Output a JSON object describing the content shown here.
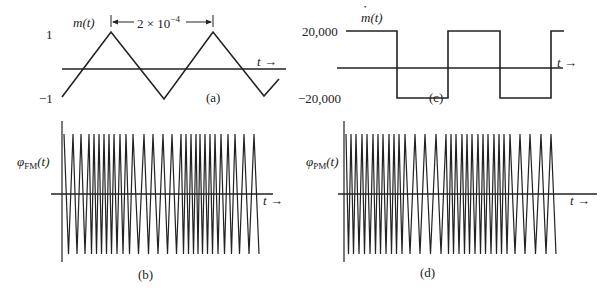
{
  "figure": {
    "panels": {
      "a": {
        "caption": "(a)",
        "ylabel_func": "m",
        "ylabel_arg": "(t)",
        "tick_top": "1",
        "tick_bottom": "−1",
        "period_label_base": "2 × 10",
        "period_label_exp": "−4",
        "axis_label": "t",
        "arrow": "→"
      },
      "b": {
        "caption": "(b)",
        "ylabel_sym": "φ",
        "ylabel_sub": "FM",
        "ylabel_arg": "(t)",
        "axis_label": "t",
        "arrow": "→"
      },
      "c": {
        "caption": "(c)",
        "ylabel_func": "m",
        "ylabel_arg": "(t)",
        "tick_top": "20,000",
        "tick_bottom": "−20,000",
        "axis_label": "t",
        "arrow": "→"
      },
      "d": {
        "caption": "(d)",
        "ylabel_sym": "φ",
        "ylabel_sub": "PM",
        "ylabel_arg": "(t)",
        "axis_label": "t",
        "arrow": "→"
      }
    }
  },
  "chart_data": [
    {
      "type": "line",
      "panel": "a",
      "title": "(a)",
      "ylabel": "m(t)",
      "xlabel": "t",
      "description": "Triangular modulating signal, period 2 × 10^-4",
      "ylim": [
        -1,
        1
      ],
      "yticks": [
        "1",
        "−1"
      ],
      "period": 0.0002,
      "points_px": [
        [
          62,
          97
        ],
        [
          111,
          32
        ],
        [
          164,
          99
        ],
        [
          213,
          32
        ],
        [
          264,
          96
        ],
        [
          279,
          79
        ]
      ]
    },
    {
      "type": "line",
      "panel": "c",
      "title": "(c)",
      "ylabel": "ṁ(t)",
      "xlabel": "t",
      "description": "Square wave derivative of m(t)",
      "ylim": [
        -20000,
        20000
      ],
      "yticks": [
        "20,000",
        "−20,000"
      ],
      "segments": [
        {
          "level": 20000,
          "x_px": [
            346,
            397
          ]
        },
        {
          "level": -20000,
          "x_px": [
            397,
            448
          ]
        },
        {
          "level": 20000,
          "x_px": [
            448,
            500
          ]
        },
        {
          "level": -20000,
          "x_px": [
            500,
            551
          ]
        },
        {
          "level": 20000,
          "x_px": [
            551,
            564
          ]
        }
      ]
    },
    {
      "type": "line",
      "panel": "b",
      "title": "(b)",
      "ylabel": "φFM(t)",
      "xlabel": "t",
      "description": "FM wave: instantaneous frequency follows triangular m(t); dense near m peaks, sparse near troughs",
      "peak_x_px": [
        64,
        73,
        81,
        89,
        94,
        99,
        104,
        109,
        114,
        120,
        126,
        133,
        144,
        153,
        163,
        172,
        181,
        186,
        191,
        196,
        200,
        205,
        210,
        215,
        221,
        228,
        235,
        244,
        254
      ]
    },
    {
      "type": "line",
      "panel": "d",
      "title": "(d)",
      "ylabel": "φPM(t)",
      "xlabel": "t",
      "description": "PM wave: instantaneous frequency follows square-wave ṁ(t); alternates high-frequency and low-frequency segments",
      "peak_x_px": [
        346,
        351,
        356,
        362,
        367,
        373,
        378,
        383,
        389,
        394,
        399,
        405,
        415,
        425,
        436,
        446,
        451,
        456,
        462,
        467,
        472,
        478,
        483,
        488,
        494,
        499,
        504,
        510,
        520,
        530,
        541,
        551
      ]
    }
  ]
}
